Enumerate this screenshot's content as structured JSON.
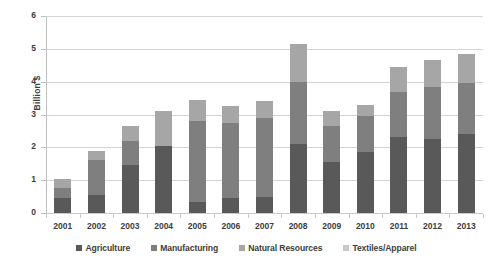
{
  "chart_data": {
    "type": "bar",
    "stacked": true,
    "title": "",
    "xlabel": "",
    "ylabel": "Billion $",
    "ylim": [
      0,
      6
    ],
    "ytick_step": 1,
    "yticks": [
      "0",
      "1",
      "2",
      "3",
      "4",
      "5",
      "6"
    ],
    "grid": true,
    "legend_position": "bottom",
    "categories": [
      "2001",
      "2002",
      "2003",
      "2004",
      "2005",
      "2006",
      "2007",
      "2008",
      "2009",
      "2010",
      "2011",
      "2012",
      "2013"
    ],
    "series": [
      {
        "name": "Agriculture",
        "color": "#595959",
        "values": [
          0.45,
          0.55,
          1.45,
          2.05,
          0.35,
          0.45,
          0.5,
          2.1,
          1.55,
          1.85,
          2.3,
          2.25,
          2.4
        ]
      },
      {
        "name": "Manufacturing",
        "color": "#7f7f7f",
        "values": [
          0.3,
          1.05,
          0.75,
          0.0,
          2.45,
          2.3,
          2.4,
          1.9,
          1.1,
          1.1,
          1.4,
          1.6,
          1.55
        ]
      },
      {
        "name": "Natural Resources",
        "color": "#a6a6a6",
        "values": [
          0.3,
          0.3,
          0.45,
          1.05,
          0.65,
          0.5,
          0.5,
          1.15,
          0.45,
          0.35,
          0.75,
          0.8,
          0.9
        ]
      },
      {
        "name": "Textiles/Apparel",
        "color": "#c9c9c9",
        "values": [
          0.0,
          0.0,
          0.0,
          0.0,
          0.0,
          0.0,
          0.0,
          0.0,
          0.0,
          0.0,
          0.0,
          0.0,
          0.0
        ]
      }
    ],
    "totals": [
      1.05,
      1.9,
      2.65,
      3.1,
      3.45,
      3.25,
      3.4,
      5.15,
      3.1,
      3.3,
      4.45,
      4.65,
      4.85
    ]
  },
  "legend": {
    "items": [
      {
        "label": "Agriculture",
        "color": "#595959"
      },
      {
        "label": "Manufacturing",
        "color": "#7f7f7f"
      },
      {
        "label": "Natural Resources",
        "color": "#a6a6a6"
      },
      {
        "label": "Textiles/Apparel",
        "color": "#c9c9c9"
      }
    ]
  },
  "axis": {
    "y_title": "Billion $"
  }
}
